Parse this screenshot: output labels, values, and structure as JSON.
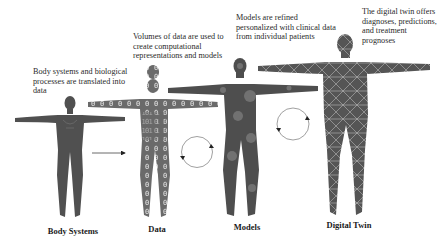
{
  "diagram": {
    "stages": [
      {
        "id": "body-systems",
        "label": "Body Systems",
        "caption": "Body systems and biological processes are translated into data",
        "figure_style": "solid-silhouette-with-organs"
      },
      {
        "id": "data",
        "label": "Data",
        "caption": "Volumes of data are used to create computational representations and models",
        "figure_style": "binary-digits-silhouette"
      },
      {
        "id": "models",
        "label": "Models",
        "caption": "Models are refined personalized with clinical data from individual patients",
        "figure_style": "silhouette-with-node-clusters"
      },
      {
        "id": "digital-twin",
        "label": "Digital Twin",
        "caption": "The digital twin offers diagnoses, predictions, and treatment prognoses",
        "figure_style": "wireframe-mesh-silhouette"
      }
    ],
    "connectors": [
      {
        "from": "body-systems",
        "to": "data",
        "icon": "arrow-right-icon"
      },
      {
        "from": "data",
        "to": "models",
        "icon": "cycle-arrows-icon"
      },
      {
        "from": "models",
        "to": "digital-twin",
        "icon": "cycle-arrows-icon"
      }
    ],
    "colors": {
      "silhouette": "#555555",
      "mesh_line": "#c8c8c8",
      "connector": "#777777",
      "text": "#222222"
    }
  }
}
